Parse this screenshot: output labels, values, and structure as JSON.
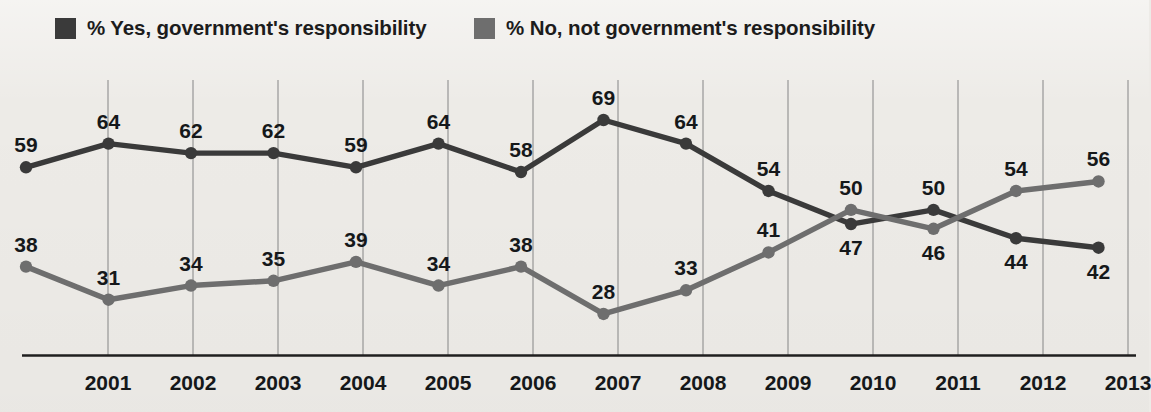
{
  "legend": {
    "items": [
      {
        "label": "% Yes, government's responsibility",
        "color": "#3a3a3a",
        "key": "yes"
      },
      {
        "label": "% No, not government's responsibility",
        "color": "#6e6e6e",
        "key": "no"
      }
    ]
  },
  "chart_data": {
    "type": "line",
    "title": "",
    "subtitle": "",
    "xlabel": "",
    "ylabel": "",
    "grid": true,
    "legend_position": "top-left",
    "ylim": [
      20,
      75
    ],
    "x": [
      "",
      "2001",
      "2002",
      "2003",
      "2004",
      "2005",
      "2006",
      "2007",
      "2008",
      "2009",
      "2010",
      "2011",
      "2012",
      "2013"
    ],
    "categories": [
      "2000",
      "2001",
      "2002",
      "2003",
      "2004",
      "2005",
      "2006",
      "2007",
      "2008",
      "2009",
      "2010",
      "2011",
      "2012",
      "2013"
    ],
    "tick_labels": [
      "2001",
      "2002",
      "2003",
      "2004",
      "2005",
      "2006",
      "2007",
      "2008",
      "2009",
      "2010",
      "2011",
      "2012",
      "2013"
    ],
    "series": [
      {
        "name": "% Yes, government's responsibility",
        "color": "#3a3a3a",
        "values": [
          59,
          64,
          62,
          62,
          59,
          64,
          58,
          69,
          64,
          54,
          47,
          50,
          44,
          42
        ],
        "label_side": [
          "above",
          "above",
          "above",
          "above",
          "above",
          "above",
          "above",
          "above",
          "above",
          "above",
          "below",
          "above",
          "below",
          "below"
        ]
      },
      {
        "name": "% No, not government's responsibility",
        "color": "#6e6e6e",
        "values": [
          38,
          31,
          34,
          35,
          39,
          34,
          38,
          28,
          33,
          41,
          50,
          46,
          54,
          56
        ],
        "label_side": [
          "above",
          "above",
          "above",
          "above",
          "above",
          "above",
          "above",
          "above",
          "above",
          "above",
          "above",
          "below",
          "above",
          "above"
        ]
      }
    ]
  },
  "axis": {
    "baseline_color": "#1f1f1f",
    "gridline_color": "#8e8e8e"
  }
}
